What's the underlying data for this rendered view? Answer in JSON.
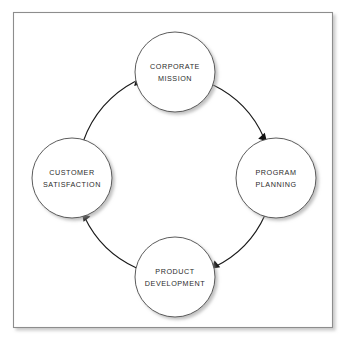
{
  "diagram": {
    "type": "cycle-diagram",
    "direction": "clockwise",
    "frame": {
      "border_color": "#8d8d8d",
      "background_color": "#ffffff",
      "shadow_color": "#c8c8c8"
    },
    "style": {
      "circle_fill": "#ffffff",
      "circle_stroke": "#4a4a4a",
      "arrow_color": "#121212",
      "text_color": "#2b2b2b"
    },
    "nodes": [
      {
        "id": "corporate-mission",
        "position": "top",
        "line1": "CORPORATE",
        "line2": "MISSION",
        "cx": 175,
        "cy": 72,
        "r": 40
      },
      {
        "id": "program-planning",
        "position": "right",
        "line1": "PROGRAM",
        "line2": "PLANNING",
        "cx": 276,
        "cy": 178,
        "r": 40
      },
      {
        "id": "product-development",
        "position": "bottom",
        "line1": "PRODUCT",
        "line2": "DEVELOPMENT",
        "cx": 175,
        "cy": 277,
        "r": 40
      },
      {
        "id": "customer-satisfaction",
        "position": "left",
        "line1": "CUSTOMER",
        "line2": "SATISFACTION",
        "cx": 72,
        "cy": 178,
        "r": 40
      }
    ],
    "arrows": [
      {
        "id": "mission-to-planning",
        "from": "corporate-mission",
        "to": "program-planning"
      },
      {
        "id": "planning-to-development",
        "from": "program-planning",
        "to": "product-development"
      },
      {
        "id": "development-to-satisfaction",
        "from": "product-development",
        "to": "customer-satisfaction"
      },
      {
        "id": "satisfaction-to-mission",
        "from": "customer-satisfaction",
        "to": "corporate-mission"
      }
    ]
  }
}
